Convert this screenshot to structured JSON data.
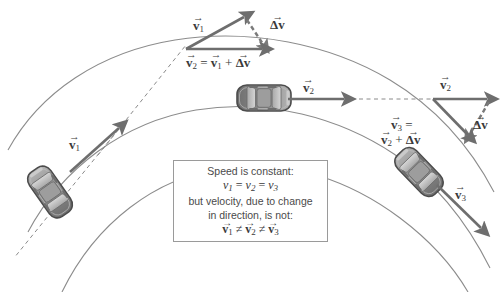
{
  "figure": {
    "background_color": "#ffffff",
    "road_color": "#8c8c8c",
    "vector_color": "#6e6e6e",
    "text_color": "#3a3a3a",
    "box_border_color": "#9a9a9a"
  },
  "info_box": {
    "line1": "Speed is constant:",
    "line2_scalar_equation": "v1 = v2 = v3",
    "line3": "but velocity, due to change",
    "line4": "in direction, is not:",
    "line5_vector_equation": "v1 ≠ v2 ≠ v3",
    "v_symbol": "v",
    "equals": "=",
    "not_equals": "≠",
    "sub1": "1",
    "sub2": "2",
    "sub3": "3",
    "arrow_hat": "→"
  },
  "labels": {
    "v1_car": "v",
    "v1_car_sub": "1",
    "v2_car": "v",
    "v2_car_sub": "2",
    "v3_car": "v",
    "v3_car_sub": "3",
    "v1_tri": "v",
    "v1_tri_sub": "1",
    "delta_v_top": "Δv",
    "delta_v_right": "Δv",
    "v2_tri_top_prefix": "v",
    "v2_tri_top_sub": "2",
    "v2_tri_top_eq": "=",
    "v2_tri_top_rhs_v": "v",
    "v2_tri_top_rhs_sub": "1",
    "v2_tri_top_plus": "+",
    "v2_tri_top_dv": "Δv",
    "v2_tri_right": "v",
    "v2_tri_right_sub": "2",
    "v3_eq_lhs": "v",
    "v3_eq_lhs_sub": "3",
    "v3_eq_sign": "=",
    "v3_eq_rhs_v": "v",
    "v3_eq_rhs_sub": "2",
    "v3_eq_plus": "+",
    "v3_eq_dv": "Δv",
    "arrow_hat": "→"
  },
  "icons": {
    "car_top_view": "car-top-view-icon",
    "velocity_arrow": "velocity-arrow-icon",
    "delta_arrow": "delta-velocity-dashed-arrow-icon"
  },
  "cars": [
    {
      "name": "car-position-1",
      "x": 50,
      "y": 192,
      "rotation": -35
    },
    {
      "name": "car-position-2",
      "x": 264,
      "y": 98,
      "rotation": 0
    },
    {
      "name": "car-position-3",
      "x": 419,
      "y": 172,
      "rotation": 40
    }
  ]
}
